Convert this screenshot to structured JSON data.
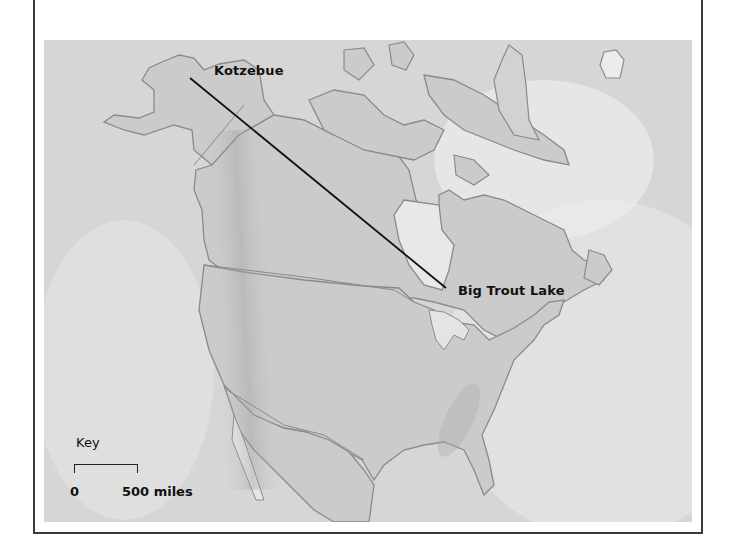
{
  "map": {
    "title": "",
    "region": "North America",
    "places": [
      {
        "name": "Kotzebue",
        "marker_x": 190,
        "marker_y": 78
      },
      {
        "name": "Big Trout Lake",
        "marker_x": 446,
        "marker_y": 288
      }
    ],
    "route_line": {
      "from": "Kotzebue",
      "to": "Big Trout Lake",
      "color": "#111111"
    }
  },
  "key": {
    "title": "Key",
    "scale_start": "0",
    "scale_end": "500 miles"
  },
  "colors": {
    "ocean": "#d9d9d9",
    "land": "#cfcfcf",
    "coast": "#8a8a8a",
    "frame": "#3a3a3a"
  }
}
